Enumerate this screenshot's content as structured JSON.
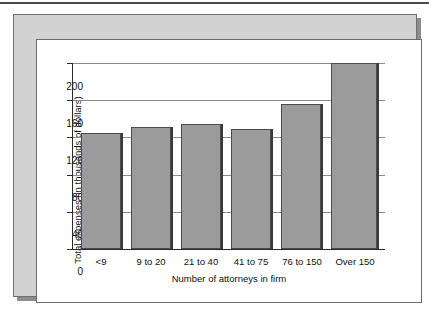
{
  "figure": {
    "background_color": "#ffffff",
    "frame_color": "#d2d2d2",
    "panel_color": "#ffffff",
    "bar_color": "#9b9b9b",
    "bar_edge_color": "#4b4b4b",
    "gridline_color": "#8c8c8c",
    "axis_color": "#2b2b2b"
  },
  "chart_data": {
    "type": "bar",
    "title": "",
    "subtitle": "",
    "xlabel": "Number of attorneys in firm",
    "ylabel": "Total expenses (in thousands of dollars)",
    "categories": [
      "<9",
      "9 to 20",
      "21 to 40",
      "41 to 75",
      "76 to 150",
      "Over 150"
    ],
    "values": [
      125,
      131,
      134,
      129,
      156,
      200
    ],
    "ylim": [
      0,
      200
    ],
    "yticks": [
      0,
      40,
      80,
      120,
      160,
      200
    ],
    "ytick_labels": [
      "0",
      "40",
      "80",
      "120",
      "160",
      "200"
    ],
    "grid": true,
    "grid_axis": "y",
    "legend": false,
    "legend_position": "none",
    "annotations": []
  }
}
